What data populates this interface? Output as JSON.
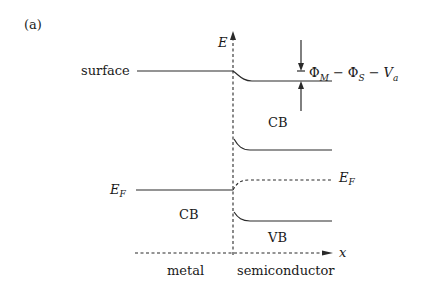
{
  "figure": {
    "panel_label": "(a)",
    "axes": {
      "y_label": "E",
      "x_label": "x"
    },
    "labels": {
      "surface": "surface",
      "fermi_metal": "E",
      "fermi_metal_sub": "F",
      "fermi_semi": "E",
      "fermi_semi_sub": "F",
      "cb_semiconductor": "CB",
      "cb_metal": "CB",
      "vb_semiconductor": "VB",
      "region_metal": "metal",
      "region_semiconductor": "semiconductor"
    },
    "barrier_annotation": {
      "phi": "Φ",
      "sub_m": "M",
      "minus1": "−",
      "phi2": "Φ",
      "sub_s": "S",
      "minus2": "−",
      "v": "V",
      "sub_a": "a"
    },
    "colors": {
      "line": "#2a2a2a",
      "text": "#1a1a1a",
      "background": "#ffffff"
    }
  }
}
